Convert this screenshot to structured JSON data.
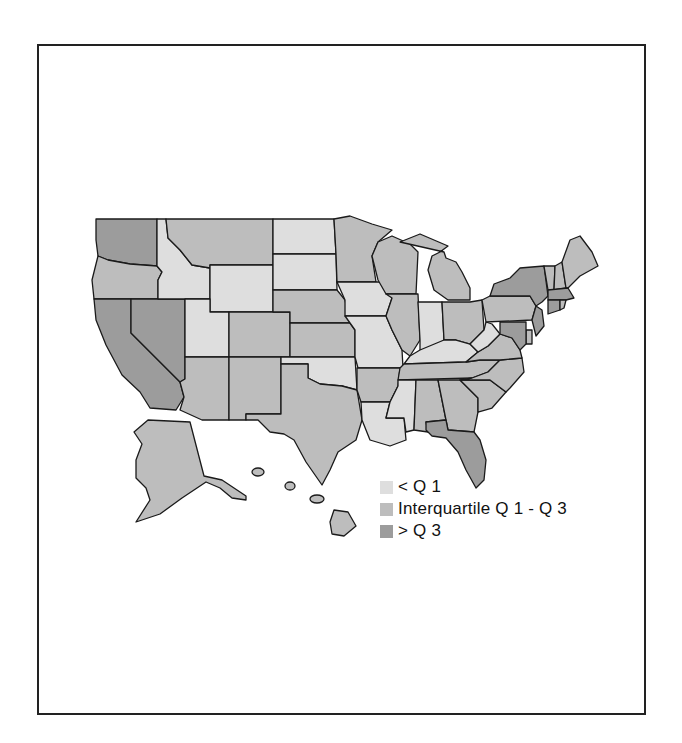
{
  "colors": {
    "low": "#dedede",
    "mid": "#bdbdbd",
    "high": "#9c9c9c",
    "border": "#1a1a1a"
  },
  "legend": {
    "items": [
      {
        "key": "low",
        "label": "< Q 1"
      },
      {
        "key": "mid",
        "label": "Interquartile Q 1 - Q 3"
      },
      {
        "key": "high",
        "label": "> Q 3"
      }
    ]
  },
  "states": {
    "WA": "high",
    "OR": "mid",
    "CA": "high",
    "NV": "high",
    "ID": "low",
    "MT": "mid",
    "WY": "low",
    "UT": "low",
    "CO": "mid",
    "AZ": "mid",
    "NM": "mid",
    "ND": "low",
    "SD": "low",
    "NE": "mid",
    "KS": "mid",
    "OK": "low",
    "TX": "mid",
    "MN": "mid",
    "IA": "low",
    "MO": "low",
    "AR": "mid",
    "LA": "low",
    "WI": "mid",
    "IL": "mid",
    "MI": "mid",
    "IN": "low",
    "OH": "mid",
    "KY": "low",
    "TN": "mid",
    "MS": "low",
    "AL": "mid",
    "GA": "mid",
    "FL": "high",
    "SC": "mid",
    "NC": "mid",
    "VA": "mid",
    "WV": "low",
    "PA": "mid",
    "NY": "high",
    "VT": "mid",
    "NH": "mid",
    "ME": "mid",
    "MA": "high",
    "CT": "high",
    "RI": "mid",
    "NJ": "high",
    "DE": "mid",
    "MD": "high",
    "AK": "mid",
    "HI": "mid"
  }
}
